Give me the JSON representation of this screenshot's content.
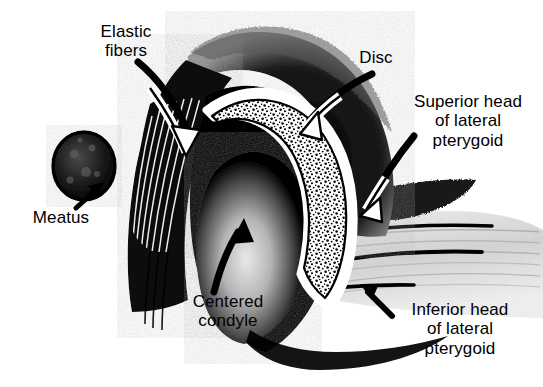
{
  "figure": {
    "kind": "anatomical-illustration",
    "background_color": "#ffffff",
    "ink_color": "#000000"
  },
  "labels": [
    {
      "id": "elastic-fibers",
      "text": "Elastic\nfibers",
      "x": 78,
      "y": 22,
      "width": 96,
      "points_to": "striated elastic fiber band on posterior (left) wall of the fossa"
    },
    {
      "id": "disc",
      "text": "Disc",
      "x": 345,
      "y": 48,
      "width": 62,
      "points_to": "stippled articular disc crescent over the condyle"
    },
    {
      "id": "superior-head-of-lateral-pterygoid",
      "text": "Superior head\nof lateral\npterygoid",
      "x": 396,
      "y": 92,
      "width": 144,
      "points_to": "dark muscle band at the anterior band of the disc"
    },
    {
      "id": "meatus",
      "text": "Meatus",
      "x": 18,
      "y": 208,
      "width": 86,
      "points_to": "dark mottled oval, external auditory meatus"
    },
    {
      "id": "centered-condyle",
      "text": "Centered\ncondyle",
      "x": 176,
      "y": 292,
      "width": 104,
      "points_to": "pale dome of the mandibular condyle"
    },
    {
      "id": "inferior-head-of-lateral-pterygoid",
      "text": "Inferior head\nof lateral\npterygoid",
      "x": 390,
      "y": 300,
      "width": 140,
      "points_to": "pale striated muscle below the condylar neck"
    }
  ],
  "structures": [
    {
      "id": "fossa-roof",
      "name": "Glenoid fossa / temporal bone",
      "fill": "#000000"
    },
    {
      "id": "articular-disc",
      "name": "Articular disc",
      "fill": "stipple on white"
    },
    {
      "id": "condyle",
      "name": "Mandibular condyle",
      "fill": "#000000 with pale highlight"
    },
    {
      "id": "elastic-fiber-band",
      "name": "Elastic fibers (posterior attachment)",
      "fill": "black striations"
    },
    {
      "id": "meatus-oval",
      "name": "External auditory meatus",
      "fill": "#111111 mottled"
    },
    {
      "id": "lateral-pterygoid",
      "name": "Lateral pterygoid muscle",
      "fill": "#d8d8d8 striated"
    }
  ]
}
